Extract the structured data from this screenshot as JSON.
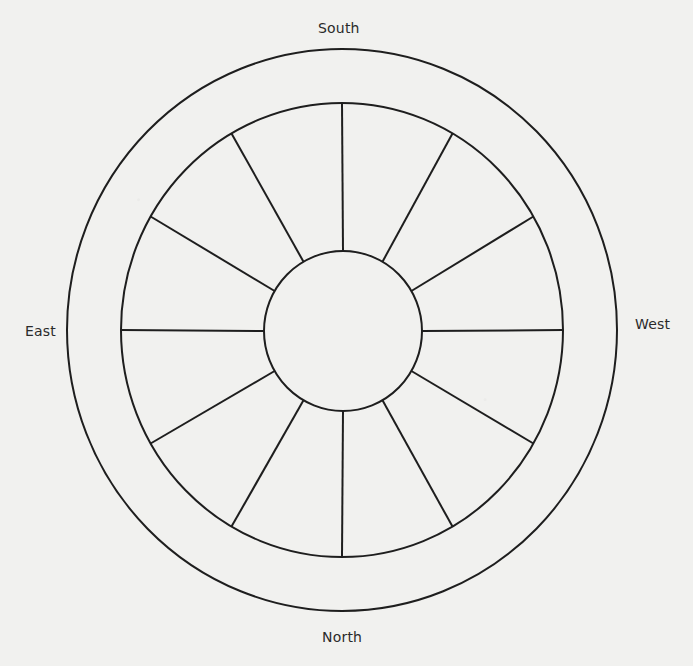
{
  "diagram": {
    "type": "directional wheel / compass diagram",
    "labels": {
      "south": "South",
      "north": "North",
      "east": "East",
      "west": "West"
    },
    "label_positions": {
      "south": "top",
      "north": "bottom",
      "east": "left",
      "west": "right"
    },
    "rings": [
      {
        "name": "outer-ring",
        "cx": 342,
        "cy": 330,
        "rx": 275,
        "ry": 281
      },
      {
        "name": "middle-ring",
        "cx": 342,
        "cy": 330,
        "rx": 221,
        "ry": 227
      },
      {
        "name": "inner-hub",
        "cx": 343,
        "cy": 331,
        "rx": 79,
        "ry": 80
      }
    ],
    "spoke_count": 12,
    "spoke_angle_step_deg": 30,
    "stroke_color": "#1e1e1e",
    "background_color": "#f1f1ef"
  }
}
